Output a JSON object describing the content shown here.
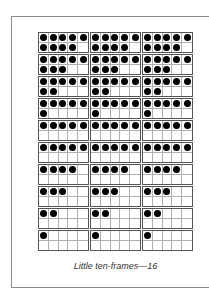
{
  "caption": "Little ten-frames—16",
  "columns": 3,
  "rows": [
    9,
    8,
    7,
    6,
    5,
    5,
    4,
    3,
    2,
    1
  ],
  "colors": {
    "dot": "#000000",
    "frame_border": "#555555",
    "cell_line": "#b0b0b0"
  }
}
